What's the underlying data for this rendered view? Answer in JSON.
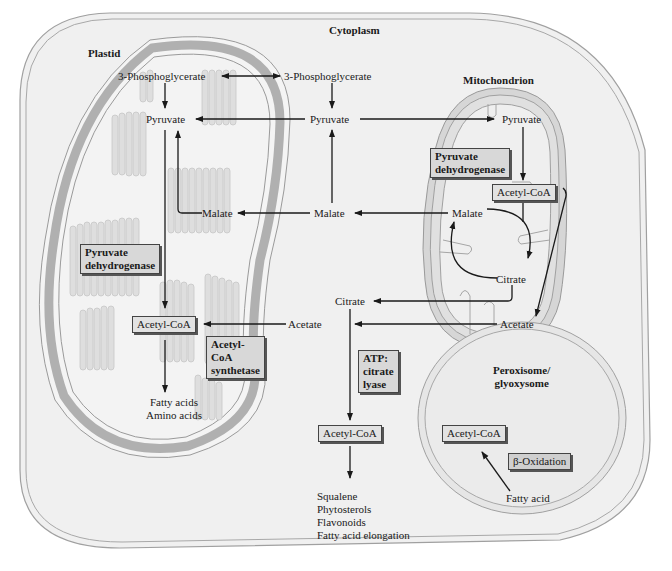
{
  "compartments": {
    "cytoplasm": "Cytoplasm",
    "plastid": "Plastid",
    "mitochondrion": "Mitochondrion",
    "peroxisome": "Peroxisome/\nglyoxysome",
    "peroxisome_line1": "Peroxisome/",
    "peroxisome_line2": "glyoxysome"
  },
  "metabolites": {
    "plastid_3pg": "3-Phosphoglycerate",
    "cyto_3pg": "3-Phosphoglycerate",
    "plastid_pyruvate": "Pyruvate",
    "cyto_pyruvate": "Pyruvate",
    "mito_pyruvate": "Pyruvate",
    "plastid_malate": "Malate",
    "cyto_malate": "Malate",
    "mito_malate": "Malate",
    "mito_citrate": "Citrate",
    "cyto_citrate": "Citrate",
    "mito_acetate": "Acetate",
    "cyto_acetate": "Acetate",
    "fatty_acid": "Fatty acid"
  },
  "boxes": {
    "plastid_acetyl_coa": "Acetyl-CoA",
    "mito_acetyl_coa": "Acetyl-CoA",
    "cyto_acetyl_coa": "Acetyl-CoA",
    "perox_acetyl_coa": "Acetyl-CoA"
  },
  "enzymes": {
    "plastid_pdh_line1": "Pyruvate",
    "plastid_pdh_line2": "dehydrogenase",
    "mito_pdh_line1": "Pyruvate",
    "mito_pdh_line2": "dehydrogenase",
    "acs_line1": "Acetyl-",
    "acs_line2": "CoA",
    "acs_line3": "synthetase",
    "acl_line1": "ATP:",
    "acl_line2": "citrate",
    "acl_line3": "lyase",
    "beta_oxidation": "β-Oxidation"
  },
  "products": {
    "plastid": [
      "Fatty acids",
      "Amino acids"
    ],
    "cytoplasm": [
      "Squalene",
      "Phytosterols",
      "Flavonoids",
      "Fatty acid elongation"
    ]
  },
  "colors": {
    "cell_fill": "#f0f0f0",
    "membrane_outline": "#9a9a9a",
    "plastid_envelope": "#b5b5b5",
    "box_fill": "#dcdcdc",
    "arrow": "#1a1a1a"
  }
}
